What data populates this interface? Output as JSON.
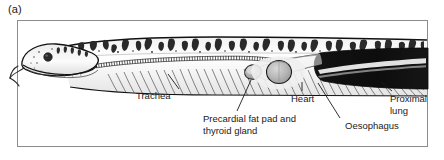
{
  "figure": {
    "panel_letter": "(a)",
    "border_color": "#8c8c8c",
    "background_color": "#ffffff",
    "leader_line_color": "#1a1a1a"
  },
  "labels": {
    "trachea": "Trachea",
    "precardial_fat_pad": "Precardial fat pad and thyroid gland",
    "heart": "Heart",
    "oesophagus": "Oesophagus",
    "proximal_lung": "Proximal lung"
  },
  "anatomy": {
    "structures": [
      {
        "name": "head",
        "note": "snake head with dark round eye, light grey scales, forked tongue protruding"
      },
      {
        "name": "dorsal-blotch-pattern",
        "note": "dark irregular saddle blotches along top of body"
      },
      {
        "name": "trachea",
        "note": "beaded cartilaginous ring tube running along ventral body"
      },
      {
        "name": "ribs",
        "note": "series of fine curved lines beneath trachea"
      },
      {
        "name": "precardial-fat-pad-and-thyroid-gland",
        "note": "small ovoid mass cranial to the heart"
      },
      {
        "name": "heart",
        "note": "large shaded oval chamber mid-body"
      },
      {
        "name": "oesophagus",
        "note": "tube running dorsal and caudal to heart"
      },
      {
        "name": "proximal-lung",
        "note": "large dark elongated structure at caudal end with pale highlight stripe"
      }
    ]
  }
}
